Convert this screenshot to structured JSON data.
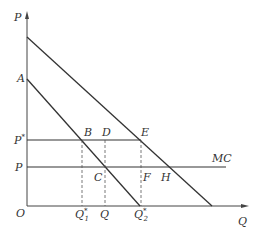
{
  "diagram": {
    "type": "economics-price-quantity",
    "axes": {
      "y_label": "P",
      "x_label": "Q",
      "origin_label": "O"
    },
    "price_labels": {
      "p_star": "P*",
      "p_star_base": "P",
      "p_star_sup": "*",
      "p": "P",
      "intercept": "A"
    },
    "quantity_labels": {
      "q1_star_base": "Q",
      "q1_star_sup": "*",
      "q1_star_sub": "1",
      "q": "Q",
      "q2_star_base": "Q",
      "q2_star_sup": "*",
      "q2_star_sub": "2"
    },
    "points": {
      "B": "B",
      "C": "C",
      "D": "D",
      "E": "E",
      "F": "F",
      "H": "H"
    },
    "curves": {
      "mc_label": "MC",
      "demand_upper": "upper demand line",
      "demand_lower": "lower demand line starting at A"
    },
    "colors": {
      "line": "#333333",
      "dashed": "#555555",
      "axis": "#444444"
    }
  }
}
